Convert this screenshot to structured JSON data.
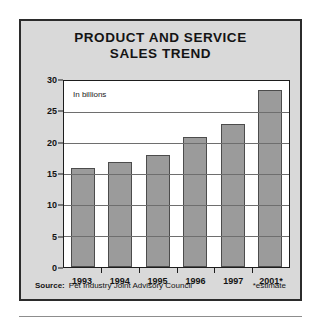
{
  "figure": {
    "title_lines": [
      "PRODUCT AND SERVICE",
      "SALES TREND"
    ],
    "note": "In billions",
    "source_label": "Source:",
    "source_text": "Pet Industry Joint Advisory Council",
    "estimate_note": "*estimate"
  },
  "colors": {
    "panel_background": "#d9d9d9",
    "panel_border": "#2b2b2b",
    "plot_background": "#ffffff",
    "bar_fill": "#9b9b9b",
    "bar_border": "#4c4c4c",
    "gridline": "#6e6e6e",
    "text": "#141414"
  },
  "chart_data": {
    "type": "bar",
    "title": "PRODUCT AND SERVICE SALES TREND",
    "subtitle": "In billions",
    "xlabel": "",
    "ylabel": "",
    "categories": [
      "1993",
      "1994",
      "1995",
      "1996",
      "1997",
      "2001*"
    ],
    "values": [
      16,
      17,
      18,
      21,
      23,
      28.5
    ],
    "ylim": [
      0,
      30
    ],
    "yticks": [
      0,
      5,
      10,
      15,
      20,
      25,
      30
    ],
    "ytick_labels": [
      "0",
      "5",
      "10",
      "15",
      "20",
      "25",
      "30"
    ],
    "grid": true,
    "legend": false,
    "units": "billions of dollars",
    "annotations": [
      "In billions",
      "*estimate"
    ],
    "source": "Pet Industry Joint Advisory Council"
  }
}
